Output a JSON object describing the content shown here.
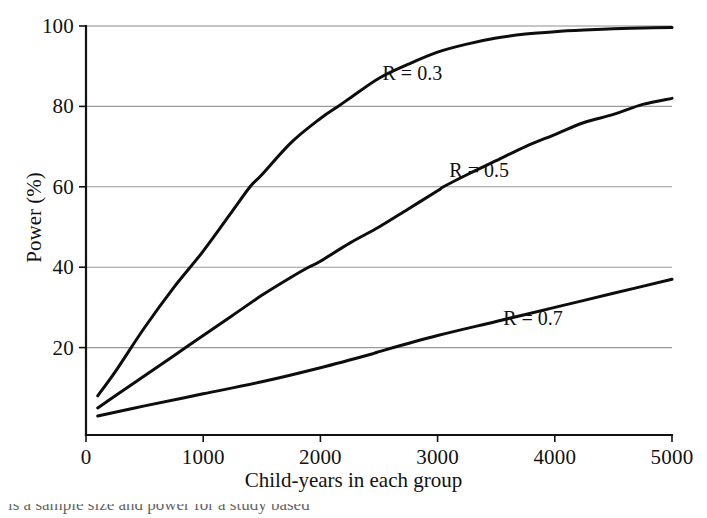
{
  "figure": {
    "background": "#ffffff",
    "ink_color": "#0d0d0d",
    "grid_color": "#9a9a9a",
    "caption_partial": "is a sample size and power for a study based"
  },
  "chart_data": {
    "type": "line",
    "title": "",
    "xlabel": "Child-years in each group",
    "ylabel": "Power (%)",
    "xlim": [
      0,
      5000
    ],
    "ylim": [
      0,
      100
    ],
    "xticks": [
      0,
      1000,
      2000,
      3000,
      4000,
      5000
    ],
    "xtick_labels": [
      "0",
      "1000",
      "2000",
      "3000",
      "4000",
      "5000"
    ],
    "yticks": [
      20,
      40,
      60,
      80,
      100
    ],
    "ytick_labels": [
      "20",
      "40",
      "60",
      "80",
      "100"
    ],
    "grid": "horizontal",
    "legend": "inline-annotations",
    "series": [
      {
        "name": "R = 0.3",
        "label": "R = 0.3",
        "label_x": 2530,
        "label_y": 88,
        "x": [
          100,
          250,
          500,
          750,
          1000,
          1250,
          1400,
          1500,
          1750,
          2000,
          2150,
          2250,
          2500,
          2750,
          3000,
          3250,
          3500,
          3750,
          4000,
          4250,
          4500,
          4750,
          5000
        ],
        "y": [
          8,
          14,
          25,
          35,
          44,
          54,
          60,
          63,
          71,
          77,
          80,
          82,
          87,
          90.5,
          93.5,
          95.5,
          97,
          98,
          98.6,
          99,
          99.3,
          99.5,
          99.6
        ]
      },
      {
        "name": "R = 0.5",
        "label": "R = 0.5",
        "label_x": 3100,
        "label_y": 64,
        "x": [
          100,
          250,
          500,
          750,
          1000,
          1250,
          1500,
          1750,
          1900,
          2000,
          2250,
          2500,
          2750,
          3000,
          3050,
          3250,
          3500,
          3750,
          4000,
          4250,
          4500,
          4750,
          5000
        ],
        "y": [
          5,
          8,
          13,
          18,
          23,
          28,
          33,
          37.5,
          40,
          41.5,
          46,
          50,
          54.5,
          59,
          60,
          63,
          66.5,
          70,
          73,
          76,
          78,
          80.5,
          82
        ]
      },
      {
        "name": "R = 0.7",
        "label": "R = 0.7",
        "label_x": 3560,
        "label_y": 27,
        "x": [
          100,
          500,
          1000,
          1500,
          2000,
          2450,
          2500,
          3000,
          3500,
          4000,
          4500,
          5000
        ],
        "y": [
          3,
          5.5,
          8.5,
          11.5,
          15,
          18.5,
          19,
          23,
          26.5,
          30,
          33.5,
          37
        ]
      }
    ]
  }
}
